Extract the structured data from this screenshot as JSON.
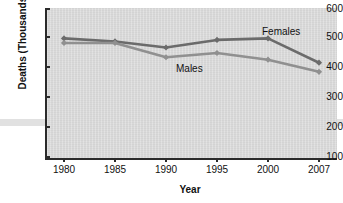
{
  "chart_data": {
    "type": "line",
    "title": "",
    "xlabel": "Year",
    "ylabel": "Deaths (Thousands)",
    "x": [
      1980,
      1985,
      1990,
      1995,
      2000,
      2007
    ],
    "categories": [
      "1980",
      "1985",
      "1990",
      "1995",
      "2000",
      "2007"
    ],
    "xtick_labels": [
      "1980",
      "1985",
      "1990",
      "1995",
      "2000",
      "2007"
    ],
    "ytick_labels": [
      "600",
      "500",
      "400",
      "300",
      "200",
      "100"
    ],
    "yticks": [
      600,
      500,
      400,
      300,
      200,
      100
    ],
    "ylim": [
      100,
      600
    ],
    "grid": false,
    "legend_position": "inline-annotations",
    "series": [
      {
        "name": "Females",
        "label": "Females",
        "color": "#6b6b6b",
        "marker": "diamond",
        "values": [
          500,
          490,
          470,
          495,
          500,
          420
        ]
      },
      {
        "name": "Males",
        "label": "Males",
        "color": "#909090",
        "marker": "diamond",
        "values": [
          485,
          485,
          438,
          452,
          430,
          390
        ]
      }
    ],
    "annotations": [
      {
        "text": "Females",
        "x": 2003,
        "y": 545
      },
      {
        "text": "Males",
        "x": 1992,
        "y": 408
      }
    ]
  },
  "axes": {
    "y_axis_title": "Deaths (Thousands)",
    "x_axis_title": "Year"
  }
}
